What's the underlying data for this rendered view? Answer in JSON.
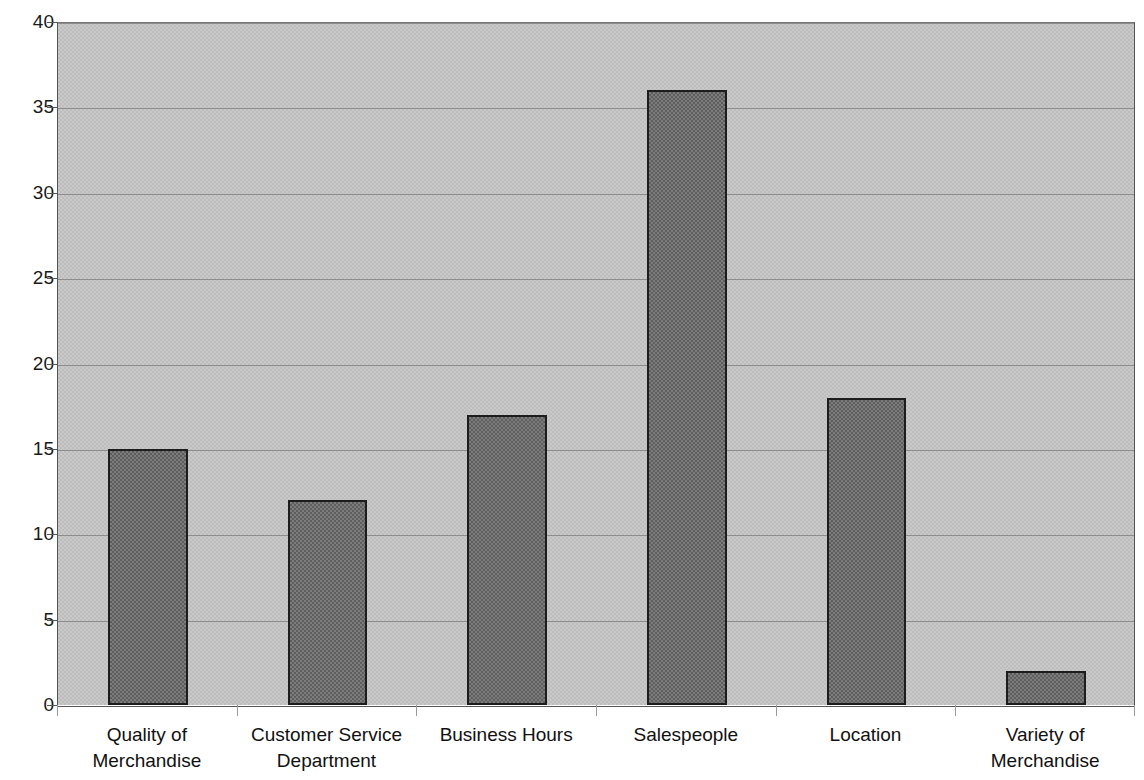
{
  "chart_data": {
    "type": "bar",
    "title": "",
    "subtitle": "",
    "xlabel": "",
    "ylabel": "",
    "categories": [
      "Quality of Merchandise",
      "Customer Service Department",
      "Business Hours",
      "Salespeople",
      "Location",
      "Variety of Merchandise"
    ],
    "category_lines": [
      [
        "Quality of",
        "Merchandise"
      ],
      [
        "Customer Service",
        "Department"
      ],
      [
        "Business Hours",
        ""
      ],
      [
        "Salespeople",
        ""
      ],
      [
        "Location",
        ""
      ],
      [
        "Variety of",
        "Merchandise"
      ]
    ],
    "values": [
      15,
      12,
      17,
      36,
      18,
      2
    ],
    "ylim": [
      0,
      40
    ],
    "ytick_step": 5,
    "ytick_labels": [
      "0",
      "5",
      "10",
      "15",
      "20",
      "25",
      "30",
      "35",
      "40"
    ],
    "ytick_values": [
      0,
      5,
      10,
      15,
      20,
      25,
      30,
      35,
      40
    ],
    "grid": true,
    "legend": false,
    "legend_position": "none",
    "colors": {
      "bar_fill": "#7c7c7c",
      "bar_fill_dither": "#5e5e5e",
      "bar_border": "#1d1d1d",
      "plot_background": "#c9c9c9",
      "plot_background_dither": "#bdbdbd",
      "gridline": "#8d8d8d",
      "axis": "#555555",
      "text": "#111111",
      "page_background": "#ffffff"
    }
  }
}
